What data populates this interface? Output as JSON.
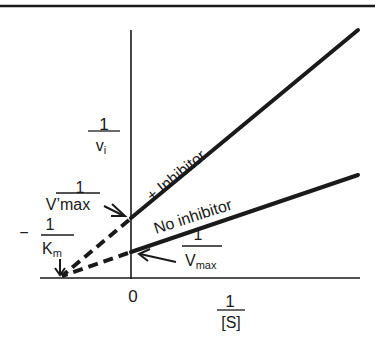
{
  "diagram": {
    "type": "lineweaver-burk-plot",
    "colors": {
      "ink": "#1a1a1a",
      "background": "#ffffff"
    },
    "axes": {
      "x_label": {
        "numerator": "1",
        "denominator": "[S]"
      },
      "y_label": {
        "numerator": "1",
        "denominator": "v",
        "denominator_sub": "i"
      },
      "origin_label": "0"
    },
    "lines": [
      {
        "name": "with-inhibitor",
        "label": "+ Inhibitor"
      },
      {
        "name": "no-inhibitor",
        "label": "No inhibitor"
      }
    ],
    "annotations": {
      "vmax_prime": {
        "numerator": "1",
        "denominator": "V’max"
      },
      "vmax": {
        "numerator": "1",
        "denominator": "V",
        "denominator_sub": "max"
      },
      "km": {
        "sign": "−",
        "numerator": "1",
        "denominator": "K",
        "denominator_sub": "m"
      }
    }
  }
}
